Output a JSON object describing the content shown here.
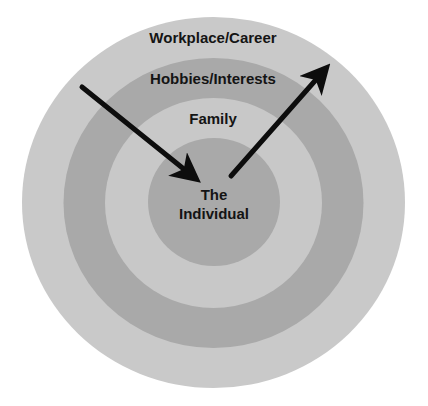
{
  "diagram": {
    "type": "concentric-circles",
    "colors": {
      "background": "#ffffff",
      "ring_light": "#c9c9c9",
      "ring_dark": "#a9a9a9",
      "arrow": "#0d0d0d",
      "text": "#141414"
    },
    "rings": [
      {
        "label": "Workplace/Career",
        "level": 1
      },
      {
        "label": "Hobbies/Interests",
        "level": 2
      },
      {
        "label": "Family",
        "level": 3
      }
    ],
    "center": {
      "line1": "The",
      "line2": "Individual"
    },
    "arrows": [
      {
        "name": "inward-arrow",
        "direction": "toward center"
      },
      {
        "name": "outward-arrow",
        "direction": "away from center"
      }
    ]
  }
}
